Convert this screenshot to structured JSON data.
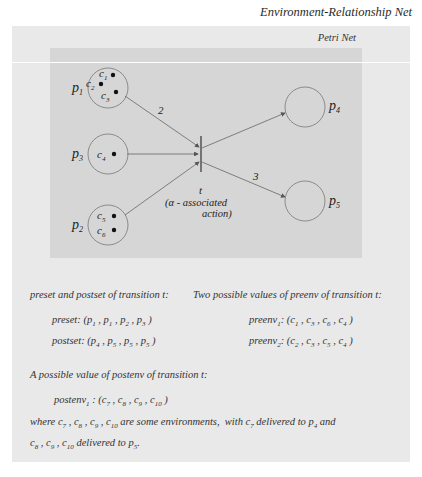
{
  "header": {
    "title": "Environment-Relationship Net",
    "inner_title": "Petri Net"
  },
  "diagram": {
    "places": [
      {
        "id": "p1",
        "label": "p",
        "sub": "1",
        "tokens": [
          "c1",
          "c2",
          "c3"
        ]
      },
      {
        "id": "p3",
        "label": "p",
        "sub": "3",
        "tokens": [
          "c4"
        ]
      },
      {
        "id": "p2",
        "label": "p",
        "sub": "2",
        "tokens": [
          "c5",
          "c6"
        ]
      },
      {
        "id": "p4",
        "label": "p",
        "sub": "4",
        "tokens": []
      },
      {
        "id": "p5",
        "label": "p",
        "sub": "5",
        "tokens": []
      }
    ],
    "transition": {
      "label": "t",
      "note_line1": "(α - associated",
      "note_line2": "action)"
    },
    "arc_weights": {
      "p1_t": "2",
      "t_p5": "3"
    }
  },
  "text": {
    "preset_heading": "preset and postset of transition t:",
    "preenv_heading": "Two possible values of preenv of transition t:",
    "preset_label": "preset:",
    "preset_value": "(p1 , p1 , p2 , p3 )",
    "postset_label": "postset:",
    "postset_value": "(p4 , p5 , p5 , p5 )",
    "preenv1_label": "preenv1:",
    "preenv1_value": "(c1 , c3 , c6 , c4 )",
    "preenv2_label": "preenv2:",
    "preenv2_value": "(c2 , c3 , c5 , c4 )",
    "postenv_heading": "A possible value of postenv of transition t:",
    "postenv1_label": "postenv1 :",
    "postenv1_value": "(c7 , c8 , c9 , c10 )",
    "where_line1": "where c7 , c8 , c9 , c10 are some environments,  with c7 delivered to p4 and",
    "where_line2": "c8 , c9 , c10 delivered to p5."
  }
}
